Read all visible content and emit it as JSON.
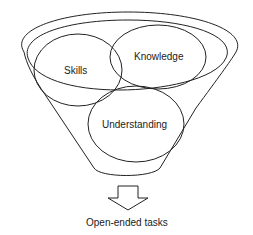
{
  "diagram": {
    "type": "funnel",
    "components": [
      {
        "id": "skills",
        "label": "Skills"
      },
      {
        "id": "knowledge",
        "label": "Knowledge"
      },
      {
        "id": "understanding",
        "label": "Understanding"
      }
    ],
    "output": {
      "label": "Open-ended tasks"
    },
    "colors": {
      "line": "#222222",
      "background": "#ffffff"
    }
  }
}
